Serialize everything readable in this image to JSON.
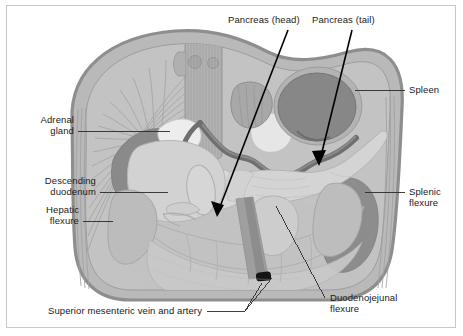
{
  "figure": {
    "domain": "Diagram",
    "kind": "anatomical-illustration",
    "frame_color": "#c9c9c9",
    "background_color": "#ffffff",
    "text_color": "#1a1a1a"
  },
  "labels": {
    "pancreas_head": "Pancreas (head)",
    "pancreas_tail": "Pancreas (tail)",
    "spleen": "Spleen",
    "adrenal_gland_line1": "Adrenal",
    "adrenal_gland_line2": "gland",
    "descending_duodenum_line1": "Descending",
    "descending_duodenum_line2": "duodenum",
    "hepatic_flexure_line1": "Hepatic",
    "hepatic_flexure_line2": "flexure",
    "splenic_flexure_line1": "Splenic",
    "splenic_flexure_line2": "flexure",
    "duodenojejunal_flexure_line1": "Duodenojejunal",
    "duodenojejunal_flexure_line2": "flexure",
    "superior_mesenteric": "Superior mesenteric vein and artery"
  },
  "palette": {
    "body_wall_outer": "#8e8e8e",
    "body_wall_fill": "#b9b9b9",
    "muscle_striation": "#aaaaaa",
    "abdominal_cavity": "#c6c6c6",
    "spine": "#a9a9a9",
    "kidney_dark": "#8a8a8a",
    "spleen_fill": "#878787",
    "stomach_fill": "#b0b0b0",
    "pancreas_fill": "#cfcfcf",
    "pancreas_light": "#dcdcdc",
    "duodenum_fill": "#d2d2d2",
    "colon_fill": "#c2c2c2",
    "adrenal_light": "#ededed",
    "vessel_dark": "#6f6f6f",
    "vessel_black": "#161616",
    "leader_line": "#2a2a2a",
    "arrow": "#000000"
  },
  "annotations": {
    "arrows": [
      {
        "name": "pancreas-head-arrow",
        "from_x": 288,
        "from_y": 30,
        "to_x": 217,
        "to_y": 217
      },
      {
        "name": "pancreas-tail-arrow",
        "from_x": 352,
        "from_y": 30,
        "to_x": 319,
        "to_y": 166
      }
    ],
    "leaders": [
      {
        "name": "spleen-leader",
        "x1": 355,
        "y1": 90,
        "x2": 405,
        "y2": 90
      },
      {
        "name": "adrenal-leader",
        "x1": 78,
        "y1": 132,
        "x2": 170,
        "y2": 131
      },
      {
        "name": "descending-duodenum-leader",
        "x1": 100,
        "y1": 192,
        "x2": 168,
        "y2": 192
      },
      {
        "name": "hepatic-flexure-leader",
        "x1": 83,
        "y1": 221,
        "x2": 113,
        "y2": 221
      },
      {
        "name": "splenic-flexure-leader",
        "x1": 365,
        "y1": 192,
        "x2": 405,
        "y2": 192
      },
      {
        "name": "duodenojejunal-leader",
        "x1": 276,
        "y1": 206,
        "x2": 325,
        "y2": 298
      },
      {
        "name": "smv-leader-main",
        "x1": 207,
        "y1": 311,
        "x2": 245,
        "y2": 311
      },
      {
        "name": "smv-leader-branch-a",
        "x1": 245,
        "y1": 311,
        "x2": 264,
        "y2": 281
      },
      {
        "name": "smv-leader-branch-b",
        "x1": 245,
        "y1": 311,
        "x2": 272,
        "y2": 277
      }
    ]
  }
}
